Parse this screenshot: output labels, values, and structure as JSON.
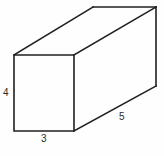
{
  "figure": {
    "name": "rectangular-prism-diagram",
    "shape": "rectangular prism",
    "background_color": "#fefefe",
    "stroke_color": "#221f1f",
    "label_color": "#2b2b2b",
    "labels": {
      "height": "4",
      "width": "3",
      "depth": "5"
    },
    "geometry": {
      "front_face": {
        "top_left": [
          14,
          55
        ],
        "top_right": [
          74,
          55
        ],
        "bottom_right": [
          74,
          131
        ],
        "bottom_left": [
          14,
          131
        ]
      },
      "back_face": {
        "top_left": [
          93,
          7
        ],
        "top_right": [
          156,
          7
        ],
        "bottom_right": [
          156,
          86
        ]
      }
    },
    "edges": {
      "front_rect": "M14,55 L74,55 L74,131 L14,131 Z",
      "top_left_diagonal": "M14,55 L93,7",
      "top_back_edge": "M93,7 L156,7",
      "top_right_diagonal": "M74,55 L156,7",
      "back_right_vertical": "M156,7 L156,86",
      "bottom_right_diagonal": "M74,131 L156,86"
    }
  }
}
